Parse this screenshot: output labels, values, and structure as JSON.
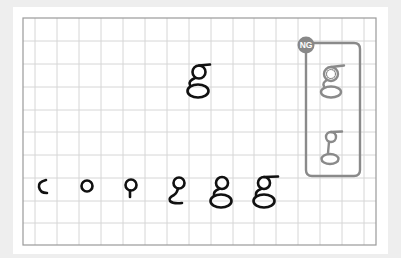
{
  "diagram": {
    "subject_letter": "g",
    "ng_badge": {
      "label": "NG",
      "color": "#888888"
    },
    "colors": {
      "page_bg": "#eeeeee",
      "card_bg": "#ffffff",
      "grid_line": "#d6d6d6",
      "grid_border": "#9a9a9a",
      "stroke_correct": "#111111",
      "stroke_ng": "#8a8a8a"
    },
    "model_glyph": {
      "label": "g",
      "description": "completed letter g (model)"
    },
    "stroke_order_steps": [
      {
        "step": 1,
        "description": "c-shaped arc"
      },
      {
        "step": 2,
        "description": "closed circle"
      },
      {
        "step": 3,
        "description": "circle with short downward stem"
      },
      {
        "step": 4,
        "description": "circle with stem curving into lower hook"
      },
      {
        "step": 5,
        "description": "circle with closed lower loop"
      },
      {
        "step": 6,
        "description": "complete g with top bar"
      }
    ],
    "ng_examples": [
      {
        "description": "upper loop drawn as dotted/rough circle"
      },
      {
        "description": "upper loop too small with long stem"
      }
    ]
  }
}
